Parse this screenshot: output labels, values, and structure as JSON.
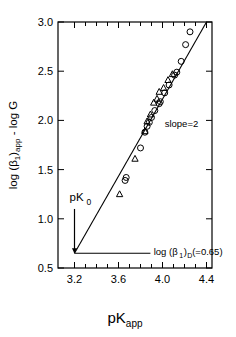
{
  "chart_data": {
    "type": "scatter",
    "title": "",
    "xlabel": "pK_app",
    "xlabel_main": "pK",
    "xlabel_sub": "app",
    "ylabel": "log (β₁)app - log G",
    "xlim": [
      3.05,
      4.45
    ],
    "ylim": [
      0.5,
      3.0
    ],
    "xticks": [
      3.2,
      3.6,
      4.0,
      4.4
    ],
    "xtick_labels": [
      "3.2",
      "3.6",
      "4.0",
      "4.4"
    ],
    "xticks_minor": [
      3.3,
      3.4,
      3.5,
      3.7,
      3.8,
      3.9,
      4.1,
      4.2,
      4.3
    ],
    "yticks": [
      0.5,
      1.0,
      1.5,
      2.0,
      2.5,
      3.0
    ],
    "ytick_labels": [
      "0.5",
      "1.0",
      "1.5",
      "2.0",
      "2.5",
      "3.0"
    ],
    "grid": false,
    "legend": null,
    "fit_line": {
      "slope": 2,
      "intercept_x": 3.2,
      "intercept_y": 0.65,
      "x_start": 3.2,
      "y_start": 0.65,
      "x_end": 4.4,
      "y_end": 3.05,
      "label": "slope=2"
    },
    "annotations": [
      {
        "name": "slope-label",
        "text": "slope=2",
        "x": 4.02,
        "y": 1.93
      },
      {
        "name": "pk0-label",
        "text": "pK₀",
        "main": "pK",
        "sub": "0",
        "x": 3.21,
        "y": 1.18
      },
      {
        "name": "beta1d-label",
        "text": "log (β₁)D (=0.65)",
        "segments": [
          "log (β",
          "1",
          ")",
          "D",
          " (=0.65)"
        ],
        "x": 3.92,
        "y": 0.67
      }
    ],
    "series": [
      {
        "name": "circles",
        "marker": "circle-open",
        "points": [
          [
            4.25,
            2.9
          ],
          [
            4.21,
            2.77
          ],
          [
            4.17,
            2.6
          ],
          [
            4.13,
            2.49
          ],
          [
            4.11,
            2.46
          ],
          [
            4.06,
            2.36
          ],
          [
            4.02,
            2.28
          ],
          [
            3.98,
            2.19
          ],
          [
            3.97,
            2.17
          ],
          [
            3.93,
            2.1
          ],
          [
            3.9,
            2.03
          ],
          [
            3.88,
            1.98
          ],
          [
            3.86,
            1.94
          ],
          [
            3.84,
            1.88
          ],
          [
            3.8,
            1.72
          ],
          [
            3.67,
            1.42
          ],
          [
            3.66,
            1.39
          ]
        ]
      },
      {
        "name": "triangles",
        "marker": "triangle-open",
        "points": [
          [
            4.09,
            2.47
          ],
          [
            4.05,
            2.41
          ],
          [
            4.01,
            2.33
          ],
          [
            3.97,
            2.29
          ],
          [
            3.95,
            2.22
          ],
          [
            3.92,
            2.18
          ],
          [
            3.89,
            2.06
          ],
          [
            3.86,
            1.99
          ],
          [
            3.84,
            1.89
          ],
          [
            3.75,
            1.61
          ],
          [
            3.61,
            1.25
          ]
        ]
      }
    ]
  },
  "figure": {
    "axes_label_x": "pK",
    "axes_label_x_sub": "app"
  }
}
